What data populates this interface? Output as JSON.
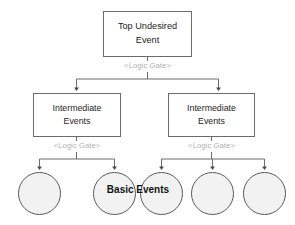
{
  "diagram": {
    "background_color": "#ffffff",
    "line_color": "#6b6b6b",
    "gate_label_color": "#b0b0b0",
    "circle_fill_color": "#f2f2f2",
    "circle_border_color": "#5a5a5a",
    "text_color": "#1c1c1c"
  },
  "top_event": {
    "line1": "Top Undesired",
    "line2": "Event"
  },
  "gates": {
    "top": "<Logic Gate>",
    "left": "<Logic Gate>",
    "right": "<Logic Gate>"
  },
  "intermediate_events": [
    {
      "line1": "Intermediate",
      "line2": "Events"
    },
    {
      "line1": "Intermediate",
      "line2": "Events"
    }
  ],
  "basic_events": {
    "label": "Basic Events",
    "count": 5,
    "circles": [
      {
        "cx": 39.5,
        "cy": 193.5,
        "r": 21.5
      },
      {
        "cx": 114.5,
        "cy": 193.5,
        "r": 21.5
      },
      {
        "cx": 161.5,
        "cy": 193.5,
        "r": 21.5
      },
      {
        "cx": 212.5,
        "cy": 193.5,
        "r": 21.5
      },
      {
        "cx": 264.5,
        "cy": 193.5,
        "r": 21.5
      }
    ]
  }
}
